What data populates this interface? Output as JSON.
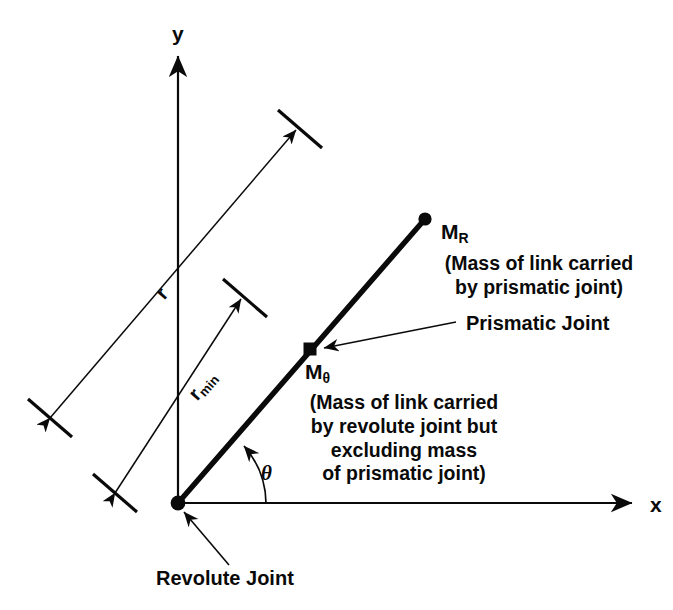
{
  "figure": {
    "kind": "kinematic-diagram",
    "background_color": "#ffffff",
    "ink_color": "#0a0a0a"
  },
  "axes": {
    "y_label": "y",
    "x_label": "x",
    "origin": {
      "x": 178,
      "y": 503
    },
    "y_axis_top": {
      "x": 178,
      "y": 52
    },
    "x_axis_right": {
      "x": 637,
      "y": 503
    }
  },
  "link": {
    "start": {
      "x": 178,
      "y": 503
    },
    "end": {
      "x": 425,
      "y": 219
    },
    "angle_deg_above_x": 49,
    "stroke_width": 5
  },
  "angle": {
    "symbol": "θ",
    "arc_radius": 88
  },
  "markers": {
    "revolute_joint": {
      "label": "Revolute Joint",
      "shape": "filled-circle",
      "x": 178,
      "y": 503
    },
    "prismatic_joint": {
      "label": "Prismatic Joint",
      "shape": "filled-square",
      "x": 310,
      "y": 349
    },
    "tip": {
      "shape": "filled-circle",
      "x": 425,
      "y": 219
    }
  },
  "masses": {
    "m_r": {
      "symbol": "M",
      "subscript": "R",
      "note": "(Mass of link carried\nby prismatic joint)"
    },
    "m_theta": {
      "symbol": "M",
      "subscript": "θ",
      "note": "(Mass of link carried\nby revolute joint but\nexcluding mass\nof prismatic joint)"
    }
  },
  "dimensions": [
    {
      "name": "r",
      "symbol": "r",
      "subscript": "",
      "from": {
        "x": 48,
        "y": 415
      },
      "to": {
        "x": 298,
        "y": 128
      },
      "description": "full link extension"
    },
    {
      "name": "r-min",
      "symbol": "r",
      "subscript": "min",
      "from": {
        "x": 113,
        "y": 490
      },
      "to": {
        "x": 243,
        "y": 297
      },
      "description": "minimum link extension"
    }
  ],
  "icons": {
    "arrowhead": "arrow-head-icon",
    "dim-tick": "dimension-tick-icon",
    "joint-dot": "joint-dot-icon",
    "joint-square": "joint-square-icon"
  }
}
